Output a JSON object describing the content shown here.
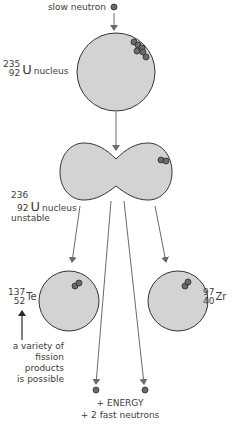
{
  "diagram": {
    "type": "nuclear-fission",
    "colors": {
      "nucleus_fill": "#d3d3d3",
      "nucleus_stroke": "#333333",
      "neutron_fill": "#6b6b6b",
      "neutron_stroke": "#2a2a2a",
      "arrow": "#6a6a6a",
      "text": "#3d3d3d"
    },
    "incoming": {
      "label": "slow neutron"
    },
    "u235": {
      "mass_number": "235",
      "atomic_number": "92",
      "symbol": "U",
      "label": "nucleus"
    },
    "u236": {
      "mass_number": "236",
      "atomic_number": "92",
      "symbol": "U",
      "label": "nucleus",
      "note": "unstable"
    },
    "product_left": {
      "mass_number": "137",
      "atomic_number": "52",
      "symbol": "Te"
    },
    "product_right": {
      "mass_number": "97",
      "atomic_number": "40",
      "symbol": "Zr"
    },
    "annotation": {
      "lines": [
        "a variety of",
        "fission",
        "products",
        "is possible"
      ]
    },
    "outputs": {
      "energy": "+ ENERGY",
      "neutrons": "+ 2 fast neutrons"
    }
  }
}
